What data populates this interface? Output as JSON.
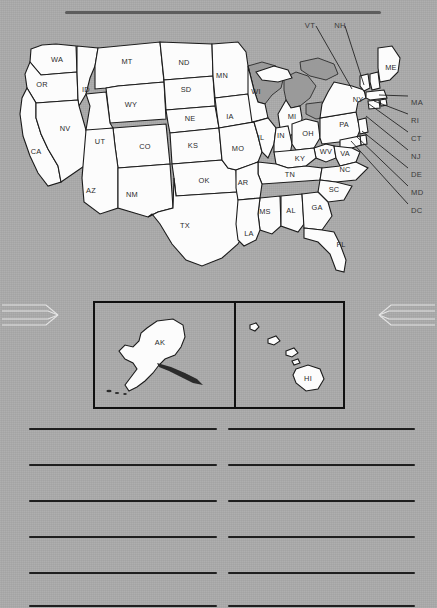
{
  "worksheet": {
    "background_color": "#a9a9a9",
    "title_rule": {
      "name": "title-rule",
      "label": ""
    }
  },
  "map": {
    "name": "united-states-map",
    "ink_color": "#1c1c1c",
    "state_fill": "#fcfcfc",
    "lake_fill": "#9a9a9a",
    "labeled_states": [
      {
        "abbr": "WA",
        "x": 57,
        "y": 42
      },
      {
        "abbr": "OR",
        "x": 42,
        "y": 67
      },
      {
        "abbr": "ID",
        "x": 86,
        "y": 72
      },
      {
        "abbr": "MT",
        "x": 127,
        "y": 44
      },
      {
        "abbr": "ND",
        "x": 184,
        "y": 45
      },
      {
        "abbr": "MN",
        "x": 222,
        "y": 58
      },
      {
        "abbr": "WI",
        "x": 256,
        "y": 74
      },
      {
        "abbr": "SD",
        "x": 186,
        "y": 72
      },
      {
        "abbr": "WY",
        "x": 131,
        "y": 87
      },
      {
        "abbr": "NV",
        "x": 65,
        "y": 111
      },
      {
        "abbr": "UT",
        "x": 100,
        "y": 124
      },
      {
        "abbr": "NE",
        "x": 190,
        "y": 101
      },
      {
        "abbr": "IA",
        "x": 230,
        "y": 99
      },
      {
        "abbr": "CA",
        "x": 36,
        "y": 134
      },
      {
        "abbr": "CO",
        "x": 145,
        "y": 129
      },
      {
        "abbr": "KS",
        "x": 193,
        "y": 128
      },
      {
        "abbr": "MO",
        "x": 238,
        "y": 131
      },
      {
        "abbr": "IL",
        "x": 261,
        "y": 120
      },
      {
        "abbr": "IN",
        "x": 281,
        "y": 118
      },
      {
        "abbr": "MI",
        "x": 292,
        "y": 99
      },
      {
        "abbr": "OH",
        "x": 308,
        "y": 116
      },
      {
        "abbr": "PA",
        "x": 344,
        "y": 107
      },
      {
        "abbr": "NY",
        "x": 358,
        "y": 82
      },
      {
        "abbr": "ME",
        "x": 391,
        "y": 50
      },
      {
        "abbr": "WV",
        "x": 326,
        "y": 134
      },
      {
        "abbr": "VA",
        "x": 345,
        "y": 136
      },
      {
        "abbr": "KY",
        "x": 300,
        "y": 141
      },
      {
        "abbr": "NC",
        "x": 345,
        "y": 152
      },
      {
        "abbr": "TN",
        "x": 290,
        "y": 157
      },
      {
        "abbr": "SC",
        "x": 334,
        "y": 172
      },
      {
        "abbr": "AZ",
        "x": 91,
        "y": 173
      },
      {
        "abbr": "NM",
        "x": 132,
        "y": 177
      },
      {
        "abbr": "OK",
        "x": 204,
        "y": 163
      },
      {
        "abbr": "AR",
        "x": 243,
        "y": 165
      },
      {
        "abbr": "MS",
        "x": 265,
        "y": 194
      },
      {
        "abbr": "AL",
        "x": 291,
        "y": 193
      },
      {
        "abbr": "GA",
        "x": 317,
        "y": 190
      },
      {
        "abbr": "TX",
        "x": 185,
        "y": 208
      },
      {
        "abbr": "LA",
        "x": 249,
        "y": 216
      },
      {
        "abbr": "FL",
        "x": 341,
        "y": 227
      }
    ],
    "callouts_top": [
      {
        "abbr": "VT",
        "label_x": 310,
        "label_y": 3,
        "lx": 316,
        "ly": 8,
        "tx": 352,
        "ty": 71
      },
      {
        "abbr": "NH",
        "label_x": 340,
        "label_y": 3,
        "lx": 345,
        "ly": 8,
        "tx": 364,
        "ty": 67
      }
    ],
    "callouts_right": [
      {
        "abbr": "MA",
        "label_x": 411,
        "label_y": 80,
        "lx": 408,
        "ly": 78,
        "tx": 379,
        "ty": 77
      },
      {
        "abbr": "RI",
        "label_x": 411,
        "label_y": 98,
        "lx": 408,
        "ly": 96,
        "tx": 374,
        "ty": 83
      },
      {
        "abbr": "CT",
        "label_x": 411,
        "label_y": 116,
        "lx": 408,
        "ly": 114,
        "tx": 369,
        "ty": 86
      },
      {
        "abbr": "NJ",
        "label_x": 411,
        "label_y": 134,
        "lx": 408,
        "ly": 132,
        "tx": 366,
        "ty": 98
      },
      {
        "abbr": "DE",
        "label_x": 411,
        "label_y": 152,
        "lx": 408,
        "ly": 150,
        "tx": 362,
        "ty": 113
      },
      {
        "abbr": "MD",
        "label_x": 411,
        "label_y": 170,
        "lx": 408,
        "ly": 168,
        "tx": 356,
        "ty": 118
      },
      {
        "abbr": "DC",
        "label_x": 411,
        "label_y": 188,
        "lx": 408,
        "ly": 186,
        "tx": 351,
        "ty": 123
      }
    ]
  },
  "insets": {
    "name": "inset-boxes",
    "alaska": {
      "label": "AK",
      "name": "alaska-inset"
    },
    "hawaii": {
      "label": "HI",
      "name": "hawaii-inset"
    }
  },
  "ornaments": {
    "left": {
      "name": "chevron-right-ornament",
      "color": "#e4e4e4"
    },
    "right": {
      "name": "chevron-left-ornament",
      "color": "#e4e4e4"
    }
  },
  "answer_lines": {
    "name": "answer-lines",
    "rows": 6,
    "columns": 2,
    "line_color": "#1f1f1f",
    "row_tops": [
      4,
      40,
      76,
      112,
      148,
      181
    ]
  }
}
